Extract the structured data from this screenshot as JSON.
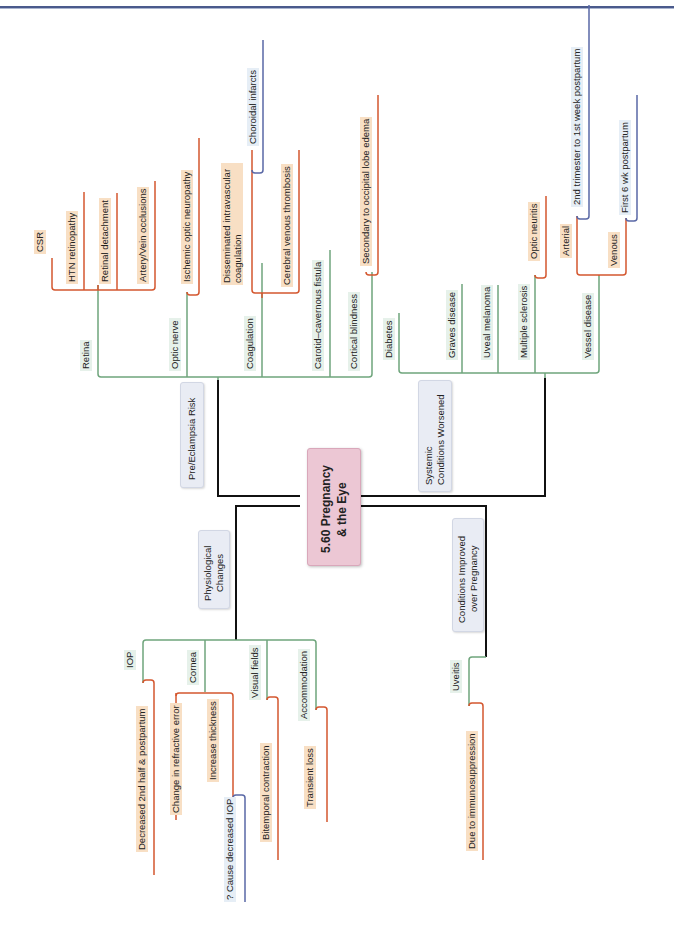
{
  "center": {
    "line1": "5.60 Pregnancy",
    "line2": "& the Eye"
  },
  "branches": {
    "pre_eclampsia": {
      "label": "Pre/Eclampsia Risk",
      "children": {
        "retina": {
          "label": "Retina",
          "items": [
            "CSR",
            "HTN retinopathy",
            "Retinal detachment",
            "Artery/Vein occlusions"
          ]
        },
        "optic_nerve": {
          "label": "Optic nerve",
          "items": [
            "Ischemic optic neuropathy"
          ]
        },
        "coagulation": {
          "label": "Coagulation",
          "dic": {
            "line1": "Disseminated intravascular",
            "line2": "coagulation",
            "items": [
              "Choroidal infarcts"
            ]
          },
          "items": [
            "Cerebral venous thrombosis"
          ]
        },
        "carotid": {
          "label": "Carotid–cavernous fistula"
        },
        "cortical": {
          "label": "Cortical blindness",
          "items": [
            "Secondary to occipital lobe edema"
          ]
        }
      }
    },
    "systemic": {
      "line1": "Systemic",
      "line2": "Conditions Worsened",
      "children": {
        "diabetes": {
          "label": "Diabetes"
        },
        "graves": {
          "label": "Graves disease"
        },
        "uveal": {
          "label": "Uveal melanoma"
        },
        "ms": {
          "label": "Multiple sclerosis",
          "items": [
            "Optic neuritis"
          ]
        },
        "vessel": {
          "label": "Vessel disease",
          "arterial": {
            "label": "Arterial",
            "items": [
              "2nd trimester to 1st week postpartum"
            ]
          },
          "venous": {
            "label": "Venous",
            "items": [
              "First 6 wk postpartum"
            ]
          }
        }
      }
    },
    "physiological": {
      "line1": "Physiological",
      "line2": "Changes",
      "children": {
        "iop": {
          "label": "IOP",
          "items": [
            "Decreased 2nd half & postpartum"
          ]
        },
        "cornea": {
          "label": "Cornea",
          "items": [
            "Change in refractive error"
          ],
          "thickness": {
            "label": "Increase thickness",
            "items": [
              "? Cause decreased IOP"
            ]
          }
        },
        "visual_fields": {
          "label": "Visual fields",
          "items": [
            "Bitemporal contraction"
          ]
        },
        "accommodation": {
          "label": "Accommodation",
          "items": [
            "Transient loss"
          ]
        }
      }
    },
    "improved": {
      "line1": "Conditions Improved",
      "line2": "over Pregnancy",
      "children": {
        "uveitis": {
          "label": "Uveitis",
          "items": [
            "Due to immunosuppression"
          ]
        }
      }
    }
  },
  "colors": {
    "trunk": "#111111",
    "level1": "#6fa57c",
    "level2": "#d4572f",
    "level3": "#5a68a6",
    "center_bg": "#ecc7d4",
    "node_bg": "#e9ecf4",
    "green_label_bg": "#e6f1ea",
    "orange_label_bg": "#f8dfc4",
    "blue_label_bg": "#e6eef6",
    "header_rule": "#4a5a8c"
  }
}
